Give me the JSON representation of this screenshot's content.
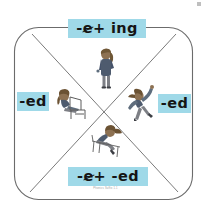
{
  "worksheet": {
    "title": "Spelling rule sorting mat",
    "shape": "rounded-square-with-x-diagonals",
    "frame_color": "#6b6b6b",
    "label_background": "#9fd9e8",
    "label_text_color": "#151515",
    "footer_text": "Phonics Suffix 1.1"
  },
  "labels": {
    "top": {
      "name": "rule-drop-e-add-ing",
      "prefix": "-",
      "struck_letter": "e",
      "suffix": " + ing",
      "full_text": "-e + ing"
    },
    "bottom": {
      "name": "rule-drop-e-add-ed",
      "prefix": "-",
      "struck_letter": "e",
      "suffix": " + -ed",
      "full_text": "-e + -ed"
    },
    "left": {
      "name": "rule-add-ed-left",
      "full_text": "-ed"
    },
    "right": {
      "name": "rule-add-ed-right",
      "full_text": "-ed"
    }
  },
  "figures": {
    "top": {
      "icon": "standing-person-icon",
      "description": "standing figure with ponytail"
    },
    "left": {
      "icon": "sitting-person-icon",
      "description": "figure seated on a chair"
    },
    "right": {
      "icon": "dancing-person-icon",
      "description": "figure dancing with arms raised"
    },
    "bottom": {
      "icon": "lying-person-icon",
      "description": "figure reclining on a bench"
    }
  }
}
